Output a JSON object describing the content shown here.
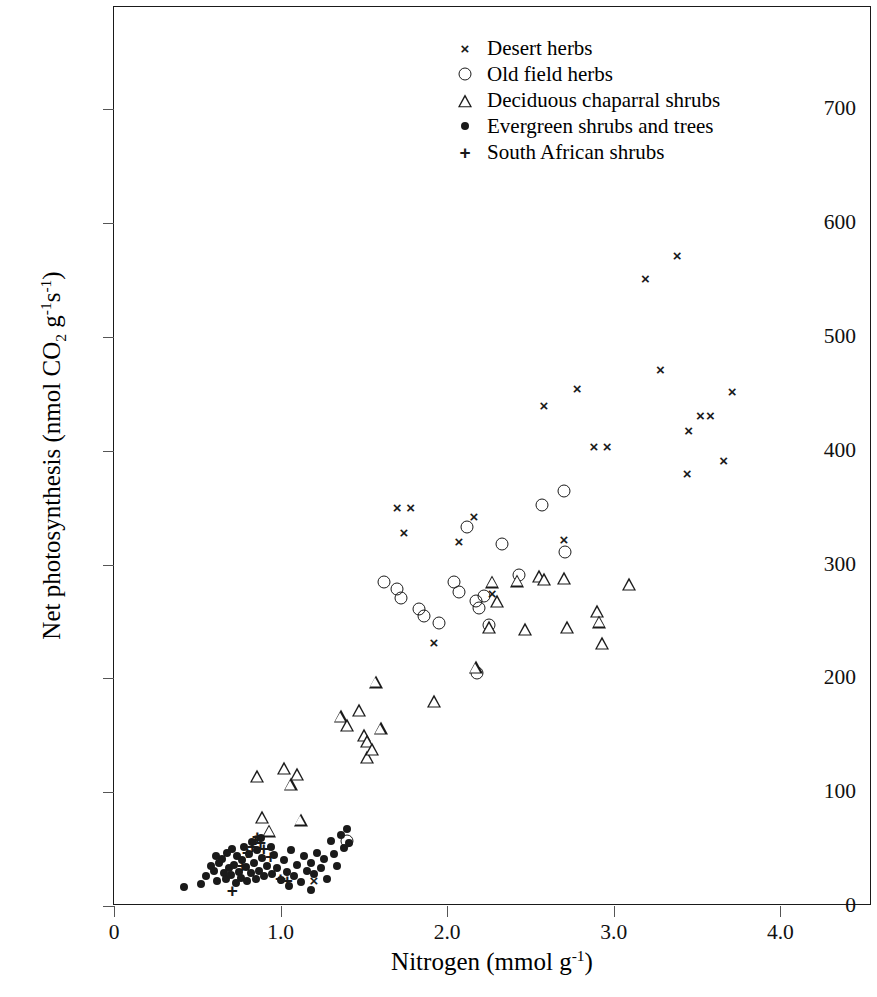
{
  "chart_data": {
    "type": "scatter",
    "title": "",
    "xlabel": "Nitrogen (mmol g-1)",
    "ylabel": "Net photosynthesis (nmol CO2 g-1 s-1)",
    "xlim": [
      0,
      4.55
    ],
    "ylim": [
      0,
      790
    ],
    "xticks": [
      0,
      1.0,
      2.0,
      3.0,
      4.0
    ],
    "xtick_labels": [
      "0",
      "1.0",
      "2.0",
      "3.0",
      "4.0"
    ],
    "yticks": [
      0,
      100,
      200,
      300,
      400,
      500,
      600,
      700
    ],
    "ytick_labels": [
      "0",
      "100",
      "200",
      "300",
      "400",
      "500",
      "600",
      "700"
    ],
    "grid": false,
    "legend_position": "top-center",
    "series": [
      {
        "name": "Desert herbs",
        "marker": "cross-icon",
        "color": "#1a1a1a",
        "points": [
          [
            1.7,
            350
          ],
          [
            1.78,
            350
          ],
          [
            1.74,
            328
          ],
          [
            1.92,
            231
          ],
          [
            2.07,
            320
          ],
          [
            2.16,
            342
          ],
          [
            2.27,
            274
          ],
          [
            2.7,
            322
          ],
          [
            2.58,
            439
          ],
          [
            2.78,
            454
          ],
          [
            2.88,
            403
          ],
          [
            2.96,
            403
          ],
          [
            3.19,
            551
          ],
          [
            3.38,
            571
          ],
          [
            3.28,
            471
          ],
          [
            3.45,
            417
          ],
          [
            3.44,
            380
          ],
          [
            3.52,
            431
          ],
          [
            3.58,
            431
          ],
          [
            3.66,
            391
          ],
          [
            3.71,
            452
          ],
          [
            1.2,
            22
          ]
        ]
      },
      {
        "name": "Old field herbs",
        "marker": "circle-icon",
        "color": "#1a1a1a",
        "points": [
          [
            1.4,
            57
          ],
          [
            1.7,
            279
          ],
          [
            1.72,
            271
          ],
          [
            1.83,
            261
          ],
          [
            1.86,
            255
          ],
          [
            1.95,
            249
          ],
          [
            2.04,
            285
          ],
          [
            2.12,
            333
          ],
          [
            2.17,
            268
          ],
          [
            2.19,
            262
          ],
          [
            2.22,
            272
          ],
          [
            2.25,
            247
          ],
          [
            2.18,
            205
          ],
          [
            2.33,
            318
          ],
          [
            2.43,
            291
          ],
          [
            2.57,
            352
          ],
          [
            2.7,
            365
          ],
          [
            2.71,
            311
          ],
          [
            1.62,
            285
          ],
          [
            2.07,
            276
          ]
        ]
      },
      {
        "name": "Deciduous chaparral shrubs",
        "marker": "triangle-icon",
        "color": "#1a1a1a",
        "points": [
          [
            0.86,
            114
          ],
          [
            0.89,
            78
          ],
          [
            0.93,
            66
          ],
          [
            1.02,
            121
          ],
          [
            1.06,
            107
          ],
          [
            1.1,
            116
          ],
          [
            1.12,
            76
          ],
          [
            1.36,
            167
          ],
          [
            1.4,
            159
          ],
          [
            1.47,
            172
          ],
          [
            1.5,
            150
          ],
          [
            1.52,
            145
          ],
          [
            1.52,
            131
          ],
          [
            1.55,
            138
          ],
          [
            1.57,
            197
          ],
          [
            1.6,
            156
          ],
          [
            1.92,
            180
          ],
          [
            2.17,
            210
          ],
          [
            2.25,
            245
          ],
          [
            2.27,
            285
          ],
          [
            2.3,
            268
          ],
          [
            2.42,
            286
          ],
          [
            2.47,
            243
          ],
          [
            2.55,
            290
          ],
          [
            2.58,
            287
          ],
          [
            2.7,
            288
          ],
          [
            2.72,
            245
          ],
          [
            2.9,
            259
          ],
          [
            2.91,
            250
          ],
          [
            2.93,
            231
          ],
          [
            3.09,
            283
          ]
        ]
      },
      {
        "name": "Evergreen shrubs and trees",
        "marker": "dot-icon",
        "color": "#1a1a1a",
        "points": [
          [
            0.42,
            17
          ],
          [
            0.55,
            26
          ],
          [
            0.58,
            35
          ],
          [
            0.6,
            31
          ],
          [
            0.61,
            44
          ],
          [
            0.62,
            22
          ],
          [
            0.63,
            38
          ],
          [
            0.65,
            41
          ],
          [
            0.66,
            29
          ],
          [
            0.67,
            24
          ],
          [
            0.68,
            47
          ],
          [
            0.69,
            33
          ],
          [
            0.7,
            27
          ],
          [
            0.71,
            50
          ],
          [
            0.72,
            36
          ],
          [
            0.73,
            20
          ],
          [
            0.74,
            44
          ],
          [
            0.75,
            30
          ],
          [
            0.76,
            25
          ],
          [
            0.77,
            40
          ],
          [
            0.78,
            52
          ],
          [
            0.79,
            34
          ],
          [
            0.8,
            22
          ],
          [
            0.81,
            46
          ],
          [
            0.82,
            29
          ],
          [
            0.83,
            56
          ],
          [
            0.84,
            38
          ],
          [
            0.85,
            24
          ],
          [
            0.86,
            49
          ],
          [
            0.87,
            31
          ],
          [
            0.88,
            60
          ],
          [
            0.89,
            42
          ],
          [
            0.9,
            26
          ],
          [
            0.92,
            35
          ],
          [
            0.94,
            52
          ],
          [
            0.95,
            28
          ],
          [
            0.96,
            45
          ],
          [
            0.98,
            33
          ],
          [
            1.0,
            23
          ],
          [
            1.02,
            40
          ],
          [
            1.04,
            30
          ],
          [
            1.06,
            49
          ],
          [
            1.08,
            26
          ],
          [
            1.1,
            36
          ],
          [
            1.12,
            21
          ],
          [
            1.14,
            44
          ],
          [
            1.16,
            31
          ],
          [
            1.18,
            38
          ],
          [
            1.2,
            28
          ],
          [
            1.22,
            47
          ],
          [
            1.24,
            33
          ],
          [
            1.26,
            41
          ],
          [
            1.28,
            24
          ],
          [
            1.3,
            57
          ],
          [
            1.32,
            46
          ],
          [
            1.34,
            35
          ],
          [
            1.36,
            62
          ],
          [
            1.38,
            51
          ],
          [
            1.4,
            68
          ],
          [
            1.41,
            55
          ],
          [
            1.18,
            14
          ],
          [
            1.05,
            18
          ],
          [
            0.52,
            19
          ]
        ]
      },
      {
        "name": "South African shrubs",
        "marker": "plus-icon",
        "color": "#1a1a1a",
        "points": [
          [
            0.71,
            13
          ],
          [
            0.77,
            35
          ],
          [
            0.8,
            47
          ],
          [
            0.83,
            52
          ],
          [
            0.85,
            58
          ],
          [
            0.86,
            61
          ],
          [
            0.88,
            55
          ],
          [
            0.9,
            50
          ],
          [
            0.94,
            43
          ],
          [
            1.0,
            24
          ],
          [
            1.04,
            22
          ]
        ]
      }
    ]
  },
  "legend": {
    "items": [
      {
        "marker": "cross-icon",
        "label": "Desert herbs"
      },
      {
        "marker": "circle-icon",
        "label": "Old field herbs"
      },
      {
        "marker": "triangle-icon",
        "label": "Deciduous chaparral shrubs"
      },
      {
        "marker": "dot-icon",
        "label": "Evergreen shrubs and trees"
      },
      {
        "marker": "plus-icon",
        "label": "South African shrubs"
      }
    ]
  },
  "axis_titles": {
    "x_prefix": "Nitrogen (mmol g",
    "x_sup": "-1",
    "x_suffix": ")",
    "y_prefix": "Net photosynthesis (nmol CO",
    "y_sub": "2",
    "y_mid": " g",
    "y_sup1": "-1",
    "y_mid2": "s",
    "y_sup2": "-1",
    "y_suffix": ")"
  },
  "marker_glyphs": {
    "cross-icon": "×",
    "plus-icon": "+"
  }
}
